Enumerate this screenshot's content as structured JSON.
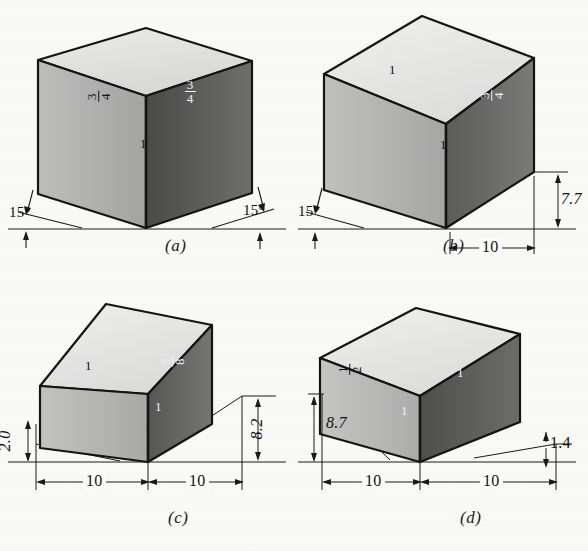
{
  "figure": {
    "background_color": "#fbfbf8",
    "ink_color": "#111111",
    "shading": {
      "top_face": "#e3e3e1",
      "left_face": "#b0b0ae",
      "right_face": "#6e6e6c",
      "right_face_dark": "#4f4f4d",
      "outline": "#141414"
    }
  },
  "panels": [
    {
      "id": "a",
      "caption": "(a)",
      "projection": "isometric",
      "face_labels": [
        {
          "position": "left-face",
          "type": "fraction",
          "numerator": "3",
          "denominator": "4",
          "text": "3/4"
        },
        {
          "position": "right-face",
          "type": "fraction",
          "numerator": "3",
          "denominator": "4",
          "text": "3/4"
        },
        {
          "position": "front-vertical-edge",
          "type": "unit",
          "text": "1"
        }
      ],
      "angles": [
        {
          "side": "left",
          "value": "15",
          "unit": "degree",
          "text": "15°"
        },
        {
          "side": "right",
          "value": "15",
          "unit": "degree",
          "text": "15°"
        }
      ],
      "dimensions": []
    },
    {
      "id": "b",
      "caption": "(b)",
      "projection": "dimetric",
      "face_labels": [
        {
          "position": "top-face",
          "type": "unit",
          "text": "1"
        },
        {
          "position": "right-face",
          "type": "fraction",
          "numerator": "3",
          "denominator": "4",
          "text": "3/4"
        },
        {
          "position": "front-vertical-edge",
          "type": "unit",
          "text": "1"
        }
      ],
      "angles": [
        {
          "side": "left",
          "value": "15",
          "unit": "degree",
          "text": "15°"
        }
      ],
      "dimensions": [
        {
          "side": "right",
          "orientation": "vertical",
          "text": "7.7"
        },
        {
          "side": "right",
          "orientation": "horizontal",
          "text": "10"
        }
      ]
    },
    {
      "id": "c",
      "caption": "(c)",
      "projection": "trimetric",
      "face_labels": [
        {
          "position": "top-face",
          "type": "unit",
          "text": "1"
        },
        {
          "position": "right-face-upper",
          "type": "fraction",
          "numerator": "5",
          "denominator": "8",
          "text": "5/8"
        },
        {
          "position": "right-face-lower",
          "type": "unit",
          "text": "1"
        }
      ],
      "angles": [],
      "dimensions": [
        {
          "side": "left",
          "orientation": "vertical",
          "text": "2.0"
        },
        {
          "side": "right",
          "orientation": "vertical",
          "text": "8.2"
        },
        {
          "side": "left",
          "orientation": "horizontal",
          "text": "10"
        },
        {
          "side": "right",
          "orientation": "horizontal",
          "text": "10"
        }
      ]
    },
    {
      "id": "d",
      "caption": "(d)",
      "projection": "trimetric",
      "face_labels": [
        {
          "position": "left-face",
          "type": "fraction",
          "numerator": "1",
          "denominator": "2",
          "text": "1/2"
        },
        {
          "position": "top-face",
          "type": "unit",
          "text": "1"
        },
        {
          "position": "right-face",
          "type": "unit",
          "text": "1"
        }
      ],
      "angles": [],
      "dimensions": [
        {
          "side": "left",
          "orientation": "vertical",
          "text": "8.7"
        },
        {
          "side": "right",
          "orientation": "vertical",
          "text": "1.4"
        },
        {
          "side": "left",
          "orientation": "horizontal",
          "text": "10"
        },
        {
          "side": "right",
          "orientation": "horizontal",
          "text": "10"
        }
      ]
    }
  ]
}
